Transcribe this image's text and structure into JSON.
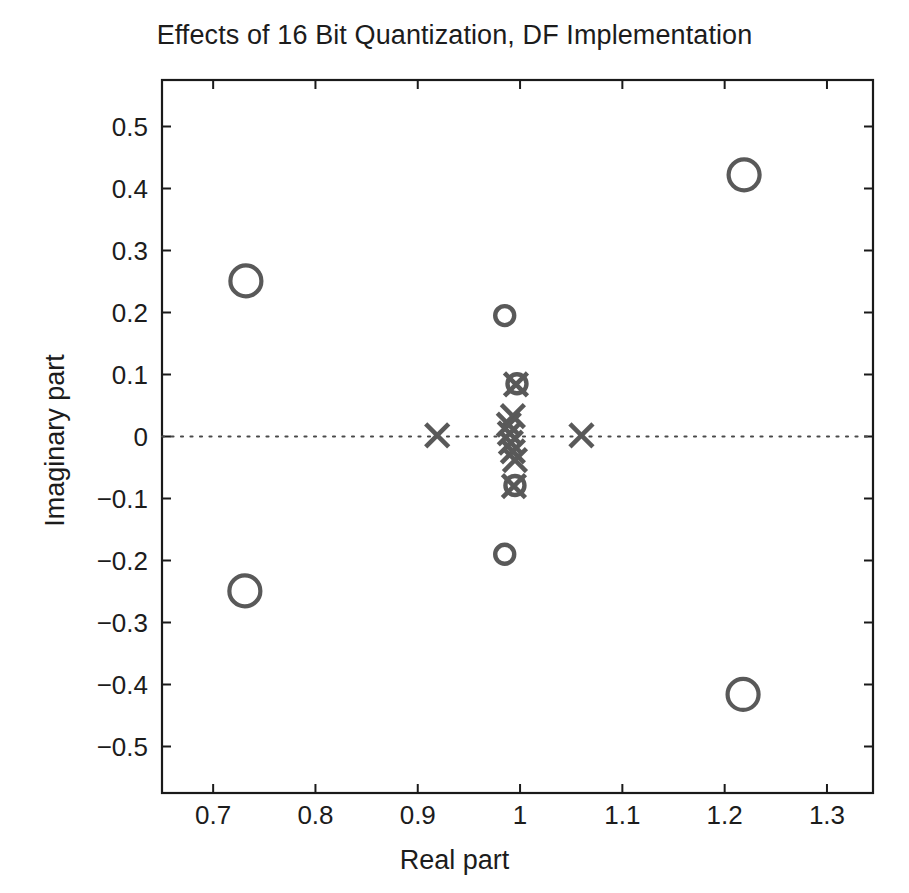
{
  "chart_data": {
    "type": "scatter",
    "title": "Effects of 16 Bit Quantization, DF Implementation",
    "xlabel": "Real part",
    "ylabel": "Imaginary part",
    "xlim": [
      0.65,
      1.345
    ],
    "ylim": [
      -0.575,
      0.575
    ],
    "xticks": [
      0.7,
      0.8,
      0.9,
      1.0,
      1.1,
      1.2,
      1.3
    ],
    "xtick_labels": [
      "0.7",
      "0.8",
      "0.9",
      "1",
      "1.1",
      "1.2",
      "1.3"
    ],
    "yticks": [
      0.5,
      0.4,
      0.3,
      0.2,
      0.1,
      0.0,
      -0.1,
      -0.2,
      -0.3,
      -0.4,
      -0.5
    ],
    "ytick_labels": [
      "0.5",
      "0.4",
      "0.3",
      "0.2",
      "0.1",
      "0",
      "−0.1",
      "−0.2",
      "−0.3",
      "−0.4",
      "−0.5"
    ],
    "grid": false,
    "legend": null,
    "marker_color": "#595959",
    "annotations": [
      {
        "name": "unit-circle",
        "type": "dotted-arc",
        "radius": 1.0,
        "center": [
          0,
          0
        ]
      },
      {
        "name": "real-axis",
        "type": "dotted-line",
        "y": 0.0
      }
    ],
    "series": [
      {
        "name": "zeros",
        "marker": "o",
        "points": [
          {
            "re": 1.219,
            "im": 0.422,
            "size": "large"
          },
          {
            "re": 0.732,
            "im": 0.251,
            "size": "large"
          },
          {
            "re": 0.731,
            "im": -0.249,
            "size": "large"
          },
          {
            "re": 1.218,
            "im": -0.416,
            "size": "large"
          },
          {
            "re": 0.985,
            "im": 0.195,
            "size": "small"
          },
          {
            "re": 0.985,
            "im": -0.19,
            "size": "small"
          },
          {
            "re": 0.997,
            "im": 0.085,
            "size": "small"
          },
          {
            "re": 0.995,
            "im": -0.079,
            "size": "small"
          }
        ]
      },
      {
        "name": "poles",
        "marker": "x",
        "points": [
          {
            "re": 0.919,
            "im": 0.002
          },
          {
            "re": 1.06,
            "im": 0.002
          },
          {
            "re": 0.996,
            "im": 0.084
          },
          {
            "re": 0.994,
            "im": -0.08
          },
          {
            "re": 0.993,
            "im": 0.033
          },
          {
            "re": 0.989,
            "im": 0.019
          },
          {
            "re": 0.99,
            "im": 0.005
          },
          {
            "re": 0.991,
            "im": -0.01
          },
          {
            "re": 0.993,
            "im": -0.024
          },
          {
            "re": 0.995,
            "im": -0.038
          }
        ]
      }
    ]
  },
  "figure": {
    "title": "Effects of 16 Bit Quantization, DF Implementation",
    "xlabel": "Real part",
    "ylabel": "Imaginary part"
  }
}
